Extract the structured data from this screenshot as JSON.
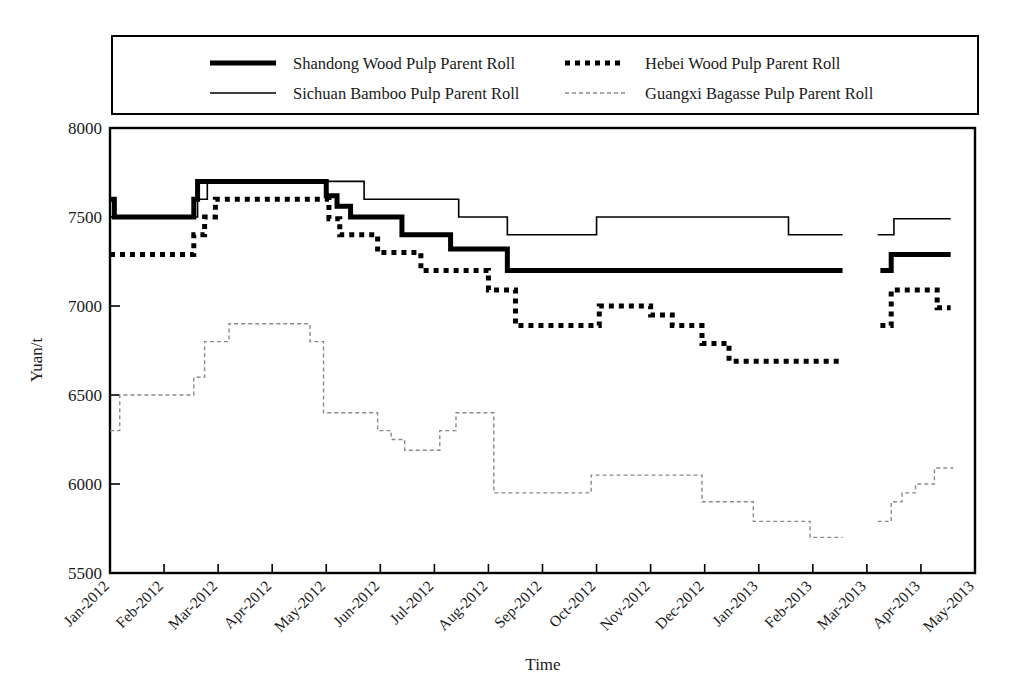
{
  "figure": {
    "background": "#ffffff",
    "caption_partial": ""
  },
  "legend": {
    "border_color": "#000000",
    "entries": [
      {
        "label": "Shandong Wood Pulp Parent Roll",
        "style": "solid-thick",
        "color": "#000000"
      },
      {
        "label": "Hebei Wood Pulp Parent Roll",
        "style": "dotted-thick",
        "color": "#000000"
      },
      {
        "label": "Sichuan Bamboo Pulp Parent Roll",
        "style": "solid-thin",
        "color": "#000000"
      },
      {
        "label": "Guangxi Bagasse Pulp Parent Roll",
        "style": "dotted-thin",
        "color": "#8a8a8a"
      }
    ]
  },
  "axes": {
    "ylabel": "Yuan/t",
    "xlabel": "Time",
    "yticks": [
      "5500",
      "6000",
      "6500",
      "7000",
      "7500",
      "8000"
    ],
    "xticks": [
      "Jan-2012",
      "Feb-2012",
      "Mar-2012",
      "Apr-2012",
      "May-2012",
      "Jun-2012",
      "Jul-2012",
      "Aug-2012",
      "Sep-2012",
      "Oct-2012",
      "Nov-2012",
      "Dec-2012",
      "Jan-2013",
      "Feb-2013",
      "Mar-2013",
      "Apr-2013",
      "May-2013"
    ]
  },
  "chart_data": {
    "type": "line",
    "title": "",
    "xlabel": "Time",
    "ylabel": "Yuan/t",
    "ylim": [
      5500,
      8000
    ],
    "xlim": [
      "Jan-2012",
      "May-2013"
    ],
    "grid": false,
    "legend_position": "top",
    "step_style": "post",
    "x_ticks": [
      "Jan-2012",
      "Feb-2012",
      "Mar-2012",
      "Apr-2012",
      "May-2012",
      "Jun-2012",
      "Jul-2012",
      "Aug-2012",
      "Sep-2012",
      "Oct-2012",
      "Nov-2012",
      "Dec-2012",
      "Jan-2013",
      "Feb-2013",
      "Mar-2013",
      "Apr-2013",
      "May-2013"
    ],
    "y_ticks": [
      5500,
      6000,
      6500,
      7000,
      7500,
      8000
    ],
    "series": [
      {
        "name": "Shandong Wood Pulp Parent Roll",
        "style": "solid-thick",
        "color": "#000000",
        "points": [
          [
            0.0,
            7600
          ],
          [
            0.08,
            7600
          ],
          [
            0.08,
            7500
          ],
          [
            1.55,
            7500
          ],
          [
            1.55,
            7600
          ],
          [
            1.62,
            7600
          ],
          [
            1.62,
            7700
          ],
          [
            4.0,
            7700
          ],
          [
            4.0,
            7620
          ],
          [
            4.2,
            7620
          ],
          [
            4.2,
            7560
          ],
          [
            4.45,
            7560
          ],
          [
            4.45,
            7500
          ],
          [
            5.4,
            7500
          ],
          [
            5.4,
            7400
          ],
          [
            6.3,
            7400
          ],
          [
            6.3,
            7320
          ],
          [
            7.35,
            7320
          ],
          [
            7.35,
            7200
          ],
          [
            13.55,
            7200
          ],
          [
            13.55,
            null
          ],
          [
            14.25,
            null
          ],
          [
            14.25,
            7200
          ],
          [
            14.45,
            7200
          ],
          [
            14.45,
            7290
          ],
          [
            15.55,
            7290
          ]
        ]
      },
      {
        "name": "Hebei Wood Pulp Parent Roll",
        "style": "dotted-thick",
        "color": "#000000",
        "points": [
          [
            0.0,
            7290
          ],
          [
            1.55,
            7290
          ],
          [
            1.55,
            7400
          ],
          [
            1.75,
            7400
          ],
          [
            1.75,
            7500
          ],
          [
            1.95,
            7500
          ],
          [
            1.95,
            7600
          ],
          [
            4.05,
            7600
          ],
          [
            4.05,
            7490
          ],
          [
            4.25,
            7490
          ],
          [
            4.25,
            7400
          ],
          [
            4.95,
            7400
          ],
          [
            4.95,
            7300
          ],
          [
            5.75,
            7300
          ],
          [
            5.75,
            7200
          ],
          [
            7.0,
            7200
          ],
          [
            7.0,
            7090
          ],
          [
            7.5,
            7090
          ],
          [
            7.5,
            6890
          ],
          [
            9.05,
            6890
          ],
          [
            9.05,
            7000
          ],
          [
            10.0,
            7000
          ],
          [
            10.0,
            6950
          ],
          [
            10.4,
            6950
          ],
          [
            10.4,
            6890
          ],
          [
            10.95,
            6890
          ],
          [
            10.95,
            6790
          ],
          [
            11.45,
            6790
          ],
          [
            11.45,
            6690
          ],
          [
            13.55,
            6690
          ],
          [
            13.55,
            null
          ],
          [
            14.25,
            null
          ],
          [
            14.25,
            6890
          ],
          [
            14.45,
            6890
          ],
          [
            14.45,
            7090
          ],
          [
            15.3,
            7090
          ],
          [
            15.3,
            6990
          ],
          [
            15.55,
            6990
          ]
        ]
      },
      {
        "name": "Sichuan Bamboo Pulp Parent Roll",
        "style": "solid-thin",
        "color": "#000000",
        "points": [
          [
            0.0,
            7500
          ],
          [
            1.62,
            7500
          ],
          [
            1.62,
            7600
          ],
          [
            1.8,
            7600
          ],
          [
            1.8,
            7700
          ],
          [
            4.7,
            7700
          ],
          [
            4.7,
            7600
          ],
          [
            6.45,
            7600
          ],
          [
            6.45,
            7500
          ],
          [
            7.35,
            7500
          ],
          [
            7.35,
            7400
          ],
          [
            9.0,
            7400
          ],
          [
            9.0,
            7500
          ],
          [
            12.55,
            7500
          ],
          [
            12.55,
            7400
          ],
          [
            13.55,
            7400
          ],
          [
            13.55,
            null
          ],
          [
            14.2,
            null
          ],
          [
            14.2,
            7400
          ],
          [
            14.5,
            7400
          ],
          [
            14.5,
            7490
          ],
          [
            15.55,
            7490
          ]
        ]
      },
      {
        "name": "Guangxi Bagasse Pulp Parent Roll",
        "style": "dotted-thin",
        "color": "#8a8a8a",
        "points": [
          [
            0.0,
            6300
          ],
          [
            0.18,
            6300
          ],
          [
            0.18,
            6500
          ],
          [
            1.55,
            6500
          ],
          [
            1.55,
            6600
          ],
          [
            1.75,
            6600
          ],
          [
            1.75,
            6800
          ],
          [
            2.2,
            6800
          ],
          [
            2.2,
            6900
          ],
          [
            3.7,
            6900
          ],
          [
            3.7,
            6800
          ],
          [
            3.95,
            6800
          ],
          [
            3.95,
            6400
          ],
          [
            4.95,
            6400
          ],
          [
            4.95,
            6300
          ],
          [
            5.2,
            6300
          ],
          [
            5.2,
            6250
          ],
          [
            5.45,
            6250
          ],
          [
            5.45,
            6190
          ],
          [
            6.1,
            6190
          ],
          [
            6.1,
            6300
          ],
          [
            6.4,
            6300
          ],
          [
            6.4,
            6400
          ],
          [
            7.1,
            6400
          ],
          [
            7.1,
            5950
          ],
          [
            8.9,
            5950
          ],
          [
            8.9,
            6050
          ],
          [
            10.95,
            6050
          ],
          [
            10.95,
            5900
          ],
          [
            11.9,
            5900
          ],
          [
            11.9,
            5790
          ],
          [
            12.95,
            5790
          ],
          [
            12.95,
            5700
          ],
          [
            13.55,
            5700
          ],
          [
            13.55,
            null
          ],
          [
            14.2,
            null
          ],
          [
            14.2,
            5790
          ],
          [
            14.45,
            5790
          ],
          [
            14.45,
            5900
          ],
          [
            14.65,
            5900
          ],
          [
            14.65,
            5950
          ],
          [
            14.9,
            5950
          ],
          [
            14.9,
            6000
          ],
          [
            15.25,
            6000
          ],
          [
            15.25,
            6090
          ],
          [
            15.6,
            6090
          ]
        ]
      }
    ]
  }
}
